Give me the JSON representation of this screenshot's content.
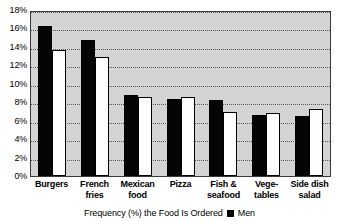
{
  "chart_data": {
    "type": "bar",
    "title": "",
    "subtitle": "",
    "xlabel": "",
    "ylabel": "",
    "ylim": [
      0,
      18
    ],
    "ytick_step": 2,
    "grid": true,
    "legend_position": "bottom",
    "categories": [
      "Burgers",
      "French\nfries",
      "Mexican\nfood",
      "Pizza",
      "Fish &\nseafood",
      "Vege-\ntables",
      "Side dish\nsalad"
    ],
    "ytick_labels": [
      "18%",
      "16%",
      "14%",
      "12%",
      "10%",
      "8%",
      "6%",
      "4%",
      "2%",
      "0%"
    ],
    "ytick_values": [
      18,
      16,
      14,
      12,
      10,
      8,
      6,
      4,
      2,
      0
    ],
    "series": [
      {
        "name": "Men",
        "color": "#050505",
        "values": [
          16.3,
          14.8,
          8.8,
          8.3,
          8.2,
          6.6,
          6.5
        ]
      },
      {
        "name": "Women",
        "color": "#fdfdfd",
        "values": [
          13.7,
          12.9,
          8.6,
          8.6,
          6.9,
          6.8,
          7.3
        ]
      }
    ],
    "caption": "Frequency (%) the Food Is Ordered",
    "legend_entries": [
      {
        "label": "Men",
        "color": "#050505"
      }
    ],
    "plot_background": "#d4d4d4",
    "axis_color": "#3a3a3a",
    "gridline_color": "#585858"
  }
}
